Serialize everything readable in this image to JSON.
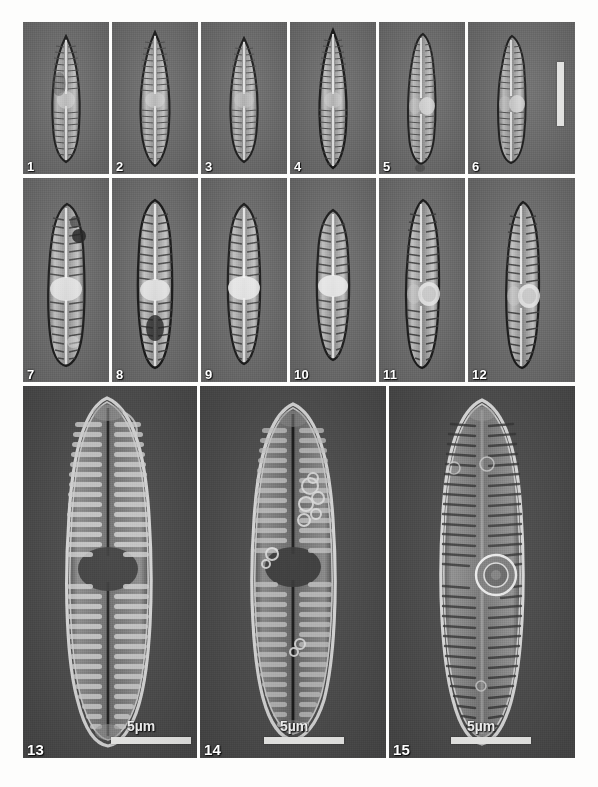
{
  "figure": {
    "kind": "micrograph-plate",
    "rows": 3,
    "background_color": "#fdfdfc",
    "lm_panel_color": "#6e6e6e",
    "sem_panel_color": "#4c4c4c",
    "label_color": "#ffffff",
    "scalebar_color": "#f5f5f3"
  },
  "row1": {
    "technique": "light-microscopy",
    "panels": [
      {
        "number": "1",
        "shape": "lanceolate",
        "valve_len": 118,
        "valve_wid": 26,
        "striae": 34,
        "central_area": "small",
        "stigma": false
      },
      {
        "number": "2",
        "shape": "lanceolate-rostrate",
        "valve_len": 126,
        "valve_wid": 29,
        "striae": 38,
        "central_area": "small",
        "stigma": false
      },
      {
        "number": "3",
        "shape": "lanceolate",
        "valve_len": 116,
        "valve_wid": 28,
        "striae": 33,
        "central_area": "small",
        "stigma": false
      },
      {
        "number": "4",
        "shape": "lanceolate-acute",
        "valve_len": 128,
        "valve_wid": 27,
        "striae": 38,
        "central_area": "small",
        "stigma": false
      },
      {
        "number": "5",
        "shape": "clavate",
        "valve_len": 120,
        "valve_wid": 28,
        "striae": 32,
        "central_area": "medium",
        "stigma": true
      },
      {
        "number": "6",
        "shape": "clavate",
        "valve_len": 116,
        "valve_wid": 30,
        "striae": 31,
        "central_area": "medium",
        "stigma": true
      }
    ],
    "scalebar": {
      "panel": "6",
      "orientation": "vertical",
      "label": ""
    }
  },
  "row2": {
    "technique": "light-microscopy",
    "panels": [
      {
        "number": "7",
        "shape": "clavate",
        "valve_len": 126,
        "valve_wid": 34,
        "striae": 30,
        "central_area": "large",
        "stigma": false
      },
      {
        "number": "8",
        "shape": "lanceolate",
        "valve_len": 130,
        "valve_wid": 31,
        "striae": 34,
        "central_area": "large",
        "stigma": false
      },
      {
        "number": "9",
        "shape": "lanceolate",
        "valve_len": 124,
        "valve_wid": 30,
        "striae": 30,
        "central_area": "large",
        "stigma": false
      },
      {
        "number": "10",
        "shape": "lanceolate",
        "valve_len": 118,
        "valve_wid": 31,
        "striae": 30,
        "central_area": "large",
        "stigma": false
      },
      {
        "number": "11",
        "shape": "clavate",
        "valve_len": 128,
        "valve_wid": 30,
        "striae": 32,
        "central_area": "medium",
        "stigma": true
      },
      {
        "number": "12",
        "shape": "clavate",
        "valve_len": 126,
        "valve_wid": 31,
        "striae": 32,
        "central_area": "medium",
        "stigma": true
      }
    ]
  },
  "row3": {
    "technique": "scanning-electron-microscopy",
    "panels": [
      {
        "number": "13",
        "view": "internal",
        "valve_len": 330,
        "valve_wid": 92,
        "striae": 44,
        "central_area": "expanded",
        "stigma": false,
        "scale_label": "5µm"
      },
      {
        "number": "14",
        "view": "internal",
        "valve_len": 318,
        "valve_wid": 88,
        "striae": 40,
        "central_area": "expanded",
        "stigma": false,
        "scale_label": "5µm",
        "debris": true
      },
      {
        "number": "15",
        "view": "external",
        "valve_len": 330,
        "valve_wid": 90,
        "striae": 46,
        "central_area": "medium",
        "stigma": true,
        "scale_label": "5µm"
      }
    ]
  },
  "scalebars": {
    "row1_bar": {
      "label": ""
    },
    "row3_label": "5µm"
  },
  "caption_bleed": {
    "line1": "",
    "line2": ""
  }
}
